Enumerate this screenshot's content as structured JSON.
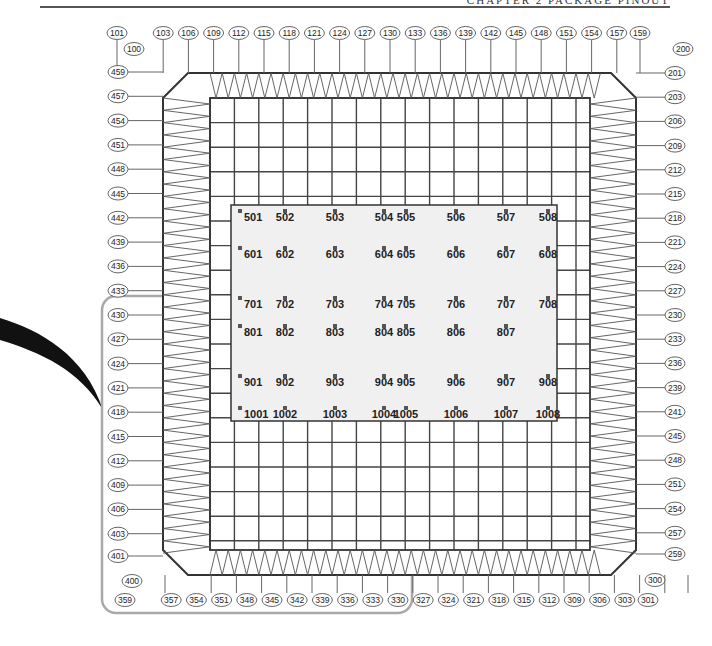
{
  "header": {
    "text": "CHAPTER 2 PACKAGE PINOUT"
  },
  "diagram": {
    "colors": {
      "grid_line": "#444444",
      "frame": "#333333",
      "center_panel": "#f0f0f0",
      "highlight_box": "#a8a8a8",
      "label_border": "#555555"
    },
    "corner_labels": {
      "top_left": "100",
      "top_right": "200",
      "bottom_right": "300",
      "bottom_left": "400"
    },
    "top_pins": [
      "101",
      "103",
      "106",
      "109",
      "112",
      "115",
      "118",
      "121",
      "124",
      "127",
      "130",
      "133",
      "136",
      "139",
      "142",
      "145",
      "148",
      "151",
      "154",
      "157",
      "159"
    ],
    "right_pins": [
      "201",
      "203",
      "206",
      "209",
      "212",
      "215",
      "218",
      "221",
      "224",
      "227",
      "230",
      "233",
      "236",
      "239",
      "241",
      "245",
      "248",
      "251",
      "254",
      "257",
      "259"
    ],
    "bottom_pins": [
      "359",
      "357",
      "354",
      "351",
      "348",
      "345",
      "342",
      "339",
      "336",
      "333",
      "330",
      "327",
      "324",
      "321",
      "318",
      "315",
      "312",
      "309",
      "306",
      "303",
      "301"
    ],
    "left_pins": [
      "459",
      "457",
      "454",
      "451",
      "448",
      "445",
      "442",
      "439",
      "436",
      "433",
      "430",
      "427",
      "424",
      "421",
      "418",
      "415",
      "412",
      "409",
      "406",
      "403",
      "401"
    ],
    "center_pads": {
      "row5": [
        "501",
        "502",
        "503",
        "504",
        "505",
        "506",
        "507",
        "508"
      ],
      "row6": [
        "601",
        "602",
        "603",
        "604",
        "605",
        "606",
        "607",
        "608"
      ],
      "row7": [
        "701",
        "702",
        "703",
        "704",
        "705",
        "706",
        "707",
        "708"
      ],
      "row8": [
        "801",
        "802",
        "803",
        "804",
        "805",
        "806",
        "807"
      ],
      "row9": [
        "901",
        "902",
        "903",
        "904",
        "905",
        "906",
        "907",
        "908"
      ],
      "row10": [
        "1001",
        "1002",
        "1003",
        "1004",
        "1005",
        "1006",
        "1007",
        "1008"
      ]
    }
  }
}
